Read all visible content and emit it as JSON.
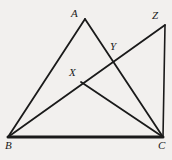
{
  "figure": {
    "background_color": "#f2f0ee",
    "stroke_color": "#1a1a1a",
    "canvas": {
      "width": 172,
      "height": 160
    },
    "points": [
      {
        "id": "A",
        "label": "A",
        "x": 85,
        "y": 19,
        "label_x": 71,
        "label_y": 8
      },
      {
        "id": "Z",
        "label": "Z",
        "x": 165,
        "y": 25,
        "label_x": 152,
        "label_y": 10
      },
      {
        "id": "Y",
        "label": "Y",
        "x": 113,
        "y": 59,
        "label_x": 110,
        "label_y": 41
      },
      {
        "id": "X",
        "label": "X",
        "x": 81,
        "y": 82,
        "label_x": 69,
        "label_y": 67
      },
      {
        "id": "B",
        "label": "B",
        "x": 8,
        "y": 137,
        "label_x": 5,
        "label_y": 140
      },
      {
        "id": "C",
        "label": "C",
        "x": 163,
        "y": 137,
        "label_x": 158,
        "label_y": 140
      }
    ],
    "segments": [
      {
        "id": "BA",
        "name": "segment-b-a",
        "from": "B",
        "to": "A",
        "x1": 8,
        "y1": 137,
        "x2": 85,
        "y2": 19,
        "width": 1.8
      },
      {
        "id": "AC",
        "name": "segment-a-c",
        "from": "A",
        "to": "C",
        "x1": 85,
        "y1": 19,
        "x2": 163,
        "y2": 137,
        "width": 1.8
      },
      {
        "id": "BZ",
        "name": "segment-b-z",
        "from": "B",
        "to": "Z",
        "x1": 8,
        "y1": 137,
        "x2": 165,
        "y2": 25,
        "width": 1.8
      },
      {
        "id": "XC",
        "name": "segment-x-c",
        "from": "X",
        "to": "C",
        "x1": 81,
        "y1": 82,
        "x2": 163,
        "y2": 137,
        "width": 1.8
      },
      {
        "id": "ZC",
        "name": "segment-z-c",
        "from": "Z",
        "to": "C",
        "x1": 165,
        "y1": 25,
        "x2": 163,
        "y2": 137,
        "width": 1.6
      },
      {
        "id": "BC",
        "name": "segment-b-c",
        "from": "B",
        "to": "C",
        "x1": 8,
        "y1": 137,
        "x2": 163,
        "y2": 137,
        "width": 3.0
      }
    ]
  }
}
